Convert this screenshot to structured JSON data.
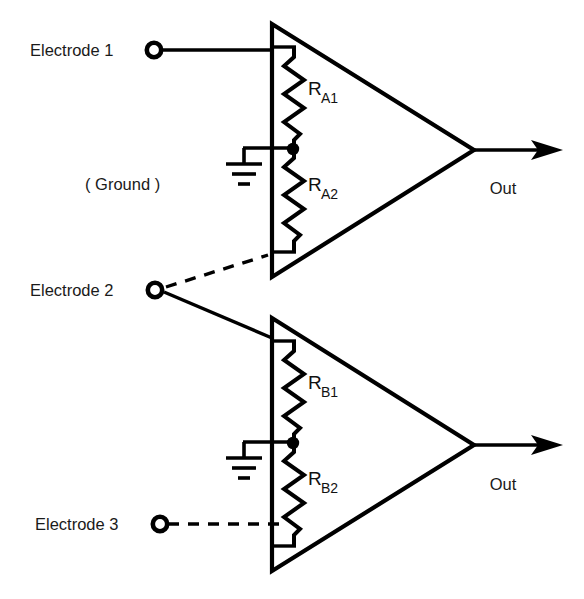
{
  "figure": {
    "type": "circuit-diagram",
    "title": "",
    "background_color": "#ffffff",
    "line_color": "#000000"
  },
  "labels": {
    "electrode1": "Electrode 1",
    "electrode2": "Electrode 2",
    "electrode3": "Electrode 3",
    "ground": "( Ground )",
    "out_top": "Out",
    "out_bottom": "Out"
  },
  "resistors": [
    {
      "id": "RA1",
      "main": "R",
      "sub": "A1"
    },
    {
      "id": "RA2",
      "main": "R",
      "sub": "A2"
    },
    {
      "id": "RB1",
      "main": "R",
      "sub": "B1"
    },
    {
      "id": "RB2",
      "main": "R",
      "sub": "B2"
    }
  ],
  "amplifiers": [
    {
      "id": "amp-a",
      "output_label": "Out",
      "gain_divider": [
        "RA1",
        "RA2"
      ]
    },
    {
      "id": "amp-b",
      "output_label": "Out",
      "gain_divider": [
        "RB1",
        "RB2"
      ]
    }
  ],
  "connections": [
    {
      "from": "Electrode 1",
      "to": "amp-a",
      "style": "solid"
    },
    {
      "from": "Electrode 2",
      "to": "amp-a",
      "style": "dashed"
    },
    {
      "from": "Electrode 2",
      "to": "amp-b",
      "style": "solid"
    },
    {
      "from": "Electrode 3",
      "to": "amp-b",
      "style": "dashed"
    },
    {
      "from": "Ground",
      "to": "RA1/RA2 tap",
      "style": "solid"
    },
    {
      "from": "Ground",
      "to": "RB1/RB2 tap",
      "style": "solid"
    }
  ],
  "icons": {
    "electrode": "electrode-terminal-icon",
    "ground": "ground-symbol-icon",
    "output": "output-arrow-icon"
  }
}
